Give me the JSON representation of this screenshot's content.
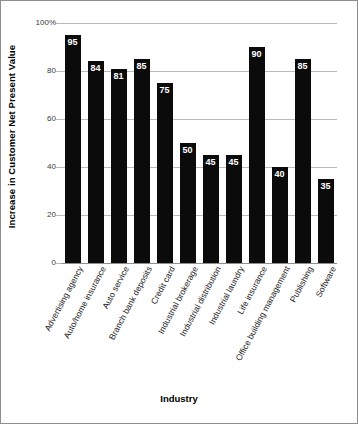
{
  "chart_data": {
    "type": "bar",
    "title": "",
    "xlabel": "Industry",
    "ylabel": "Increase in Customer Net Present Value",
    "ylim": [
      0,
      100
    ],
    "yticks": [
      0,
      20,
      40,
      60,
      80,
      100
    ],
    "ytick_labels": [
      "0",
      "20",
      "40",
      "60",
      "80",
      "100%"
    ],
    "grid": true,
    "legend": false,
    "bar_color": "#0b0b0b",
    "value_label_color": "#ffffff",
    "gridline_color": "#b9b9b9",
    "categories": [
      "Advertising agency",
      "Auto/home insurance",
      "Auto service",
      "Branch bank deposits",
      "Credit card",
      "Industrial brokerage",
      "Industrial distribution",
      "Industrial laundry",
      "Life insurance",
      "Office building management",
      "Publishing",
      "Software"
    ],
    "values": [
      95,
      84,
      81,
      85,
      75,
      50,
      45,
      45,
      90,
      40,
      85,
      35
    ],
    "value_labels": [
      "95",
      "84",
      "81",
      "85",
      "75",
      "50",
      "45",
      "45",
      "90",
      "40",
      "85",
      "35"
    ]
  }
}
